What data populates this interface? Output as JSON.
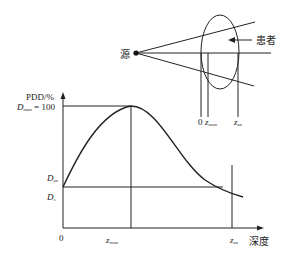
{
  "diagram": {
    "type": "percentage-depth-dose",
    "geometry": {
      "source_label": "源",
      "patient_label": "患者",
      "depth_markers": [
        "0",
        "z",
        "z"
      ],
      "depth_marker_subscripts": [
        "",
        "max",
        "ex"
      ]
    },
    "chart": {
      "y_axis_label": "PDD/%",
      "x_axis_label": "深度",
      "dmax_label_main": "D",
      "dmax_label_sub": "max",
      "dmax_label_value": " = 100",
      "dex_label_main": "D",
      "dex_label_sub": "ex",
      "ds_label_main": "D",
      "ds_label_sub": "s",
      "x_origin_label": "0",
      "x_zmax_main": "z",
      "x_zmax_sub": "max",
      "x_zex_main": "z",
      "x_zex_sub": "ex"
    },
    "colors": {
      "line": "#222222",
      "background": "#ffffff"
    }
  }
}
